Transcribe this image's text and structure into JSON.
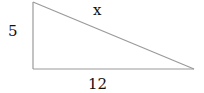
{
  "diagram": {
    "type": "right-triangle",
    "labels": {
      "vertical_side": "5",
      "hypotenuse": "x",
      "horizontal_side": "12"
    },
    "colors": {
      "stroke": "#9a9a9a",
      "text": "#111111"
    }
  }
}
